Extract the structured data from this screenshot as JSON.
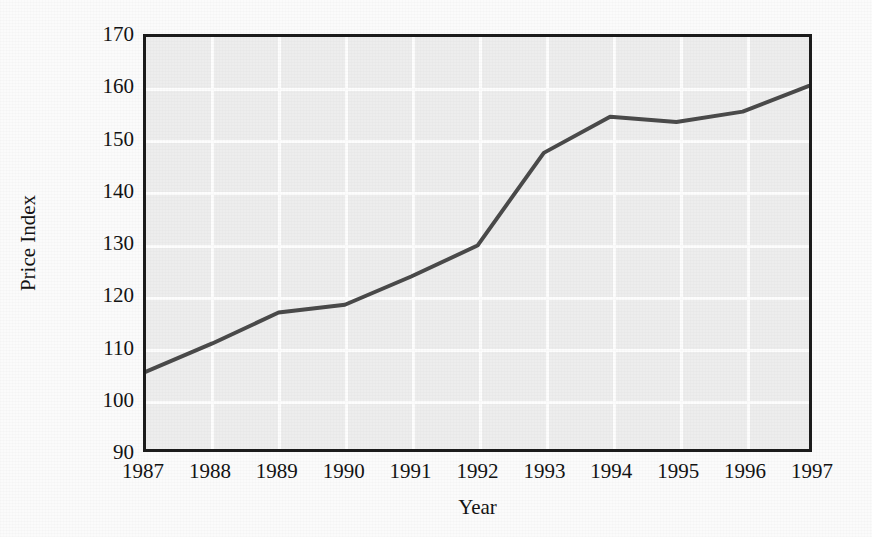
{
  "chart_data": {
    "type": "line",
    "title": "",
    "xlabel": "Year",
    "ylabel": "Price Index",
    "categories": [
      "1987",
      "1988",
      "1989",
      "1990",
      "1991",
      "1992",
      "1993",
      "1994",
      "1995",
      "1996",
      "1997"
    ],
    "x": [
      1987,
      1988,
      1989,
      1990,
      1991,
      1992,
      1993,
      1994,
      1995,
      1996,
      1997
    ],
    "values": [
      105,
      110.5,
      116.5,
      118,
      123.5,
      129.5,
      147.5,
      154.5,
      153.5,
      155.5,
      160.5
    ],
    "series": [
      {
        "name": "Price Index",
        "values": [
          105,
          110.5,
          116.5,
          118,
          123.5,
          129.5,
          147.5,
          154.5,
          153.5,
          155.5,
          160.5
        ]
      }
    ],
    "xlim": [
      1987,
      1997
    ],
    "ylim": [
      90,
      170
    ],
    "yticks": [
      "170",
      "160",
      "150",
      "140",
      "130",
      "120",
      "110",
      "100",
      "90"
    ],
    "ytick_values": [
      170,
      160,
      150,
      140,
      130,
      120,
      110,
      100,
      90
    ],
    "xticks": [
      "1987",
      "1988",
      "1989",
      "1990",
      "1991",
      "1992",
      "1993",
      "1994",
      "1995",
      "1996",
      "1997"
    ],
    "grid": true,
    "grid_color": "#fdfdfd",
    "legend": "none",
    "line_color": "#4a4a4a",
    "line_width": 4,
    "plot_background": "#ededed",
    "frame_color": "#1c1c1c",
    "figure_background": "#fbfbfb",
    "text_color": "#131313"
  }
}
